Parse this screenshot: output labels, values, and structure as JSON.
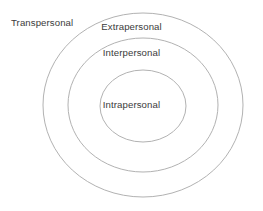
{
  "diagram": {
    "type": "concentric-circles",
    "background_color": "#ffffff",
    "stroke_color": "#b2b2b2",
    "text_color": "#3b3b3b",
    "rings": [
      {
        "id": "transpersonal",
        "label": "Transpersonal",
        "level": 4,
        "position": "outermost",
        "label_placement": "outside-top-left",
        "cx": 143,
        "cy": 105,
        "rx": 100,
        "ry": 92
      },
      {
        "id": "extrapersonal",
        "label": "Extrapersonal",
        "level": 3,
        "position": "second",
        "label_placement": "inside-top",
        "cx": 143,
        "cy": 105,
        "rx": 75,
        "ry": 67
      },
      {
        "id": "interpersonal",
        "label": "Interpersonal",
        "level": 2,
        "position": "third",
        "label_placement": "inside-top",
        "cx": 143,
        "cy": 106,
        "rx": 43,
        "ry": 36
      },
      {
        "id": "intrapersonal",
        "label": "Intrapersonal",
        "level": 1,
        "position": "innermost",
        "label_placement": "center"
      }
    ]
  }
}
